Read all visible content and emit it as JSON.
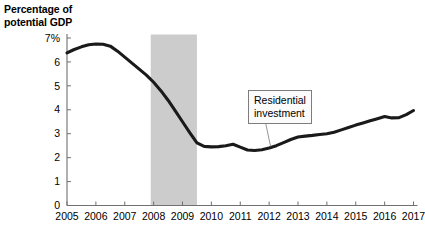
{
  "chart_data": {
    "type": "line",
    "title": "",
    "ylabel": "Percentage of potential GDP",
    "ylabel_lines": [
      "Percentage of",
      "potential GDP"
    ],
    "xlabel": "",
    "ylim": [
      0,
      7
    ],
    "xlim": [
      2005,
      2017
    ],
    "grid": false,
    "y_ticks": [
      "0",
      "1",
      "2",
      "3",
      "4",
      "5",
      "6",
      "7%"
    ],
    "y_tick_values": [
      0,
      1,
      2,
      3,
      4,
      5,
      6,
      7
    ],
    "x_ticks": [
      "2005",
      "2006",
      "2007",
      "2008",
      "2009",
      "2010",
      "2011",
      "2012",
      "2013",
      "2014",
      "2015",
      "2016",
      "2017"
    ],
    "x_tick_values": [
      2005,
      2006,
      2007,
      2008,
      2009,
      2010,
      2011,
      2012,
      2013,
      2014,
      2015,
      2016,
      2017
    ],
    "line_color": "#1a1a1a",
    "shaded_band": {
      "label": "recession-band",
      "color": "#cccccc",
      "x_start": 2007.9,
      "x_end": 2009.5
    },
    "annotations": [
      {
        "name": "residential-investment-callout",
        "text_lines": [
          "Residential",
          "investment"
        ],
        "text": "Residential investment",
        "point_x": 2012.05,
        "point_y": 2.47
      }
    ],
    "series": [
      {
        "name": "Residential investment",
        "x": [
          2005.0,
          2005.25,
          2005.5,
          2005.75,
          2006.0,
          2006.25,
          2006.5,
          2006.75,
          2007.0,
          2007.25,
          2007.5,
          2007.75,
          2008.0,
          2008.25,
          2008.5,
          2008.75,
          2009.0,
          2009.25,
          2009.5,
          2009.75,
          2010.0,
          2010.25,
          2010.5,
          2010.75,
          2011.0,
          2011.25,
          2011.5,
          2011.75,
          2012.0,
          2012.25,
          2012.5,
          2012.75,
          2013.0,
          2013.25,
          2013.5,
          2013.75,
          2014.0,
          2014.25,
          2014.5,
          2014.75,
          2015.0,
          2015.25,
          2015.5,
          2015.75,
          2016.0,
          2016.25,
          2016.5,
          2016.75,
          2017.0
        ],
        "values": [
          6.38,
          6.52,
          6.63,
          6.72,
          6.75,
          6.74,
          6.66,
          6.45,
          6.2,
          5.95,
          5.7,
          5.45,
          5.15,
          4.8,
          4.4,
          3.95,
          3.5,
          3.05,
          2.62,
          2.47,
          2.45,
          2.46,
          2.5,
          2.56,
          2.44,
          2.32,
          2.3,
          2.33,
          2.4,
          2.5,
          2.63,
          2.76,
          2.86,
          2.9,
          2.93,
          2.97,
          3.0,
          3.06,
          3.16,
          3.26,
          3.36,
          3.45,
          3.54,
          3.63,
          3.72,
          3.66,
          3.67,
          3.8,
          3.97
        ]
      }
    ]
  }
}
